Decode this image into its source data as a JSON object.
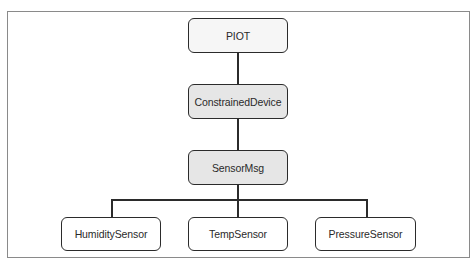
{
  "diagram": {
    "type": "hierarchy",
    "colors": {
      "frame_border": "#8a8a8a",
      "node_border": "#2b2b2b",
      "root_fill": "#f6f6f6",
      "highlight_fill": "#e6e6e6",
      "leaf_fill": "#ffffff",
      "text": "#2a2a2a",
      "connector": "#2b2b2b"
    },
    "nodes": [
      {
        "id": "piot",
        "label": "PIOT",
        "level": 0,
        "fill": "#f6f6f6"
      },
      {
        "id": "constrained_device",
        "label": "ConstrainedDevice",
        "level": 1,
        "fill": "#e6e6e6"
      },
      {
        "id": "sensor_msg",
        "label": "SensorMsg",
        "level": 2,
        "fill": "#e6e6e6"
      },
      {
        "id": "humidity_sensor",
        "label": "HumiditySensor",
        "level": 3,
        "fill": "#ffffff"
      },
      {
        "id": "temp_sensor",
        "label": "TempSensor",
        "level": 3,
        "fill": "#ffffff"
      },
      {
        "id": "pressure_sensor",
        "label": "PressureSensor",
        "level": 3,
        "fill": "#ffffff"
      }
    ],
    "edges": [
      {
        "from": "piot",
        "to": "constrained_device"
      },
      {
        "from": "constrained_device",
        "to": "sensor_msg"
      },
      {
        "from": "sensor_msg",
        "to": "humidity_sensor"
      },
      {
        "from": "sensor_msg",
        "to": "temp_sensor"
      },
      {
        "from": "sensor_msg",
        "to": "pressure_sensor"
      }
    ]
  }
}
